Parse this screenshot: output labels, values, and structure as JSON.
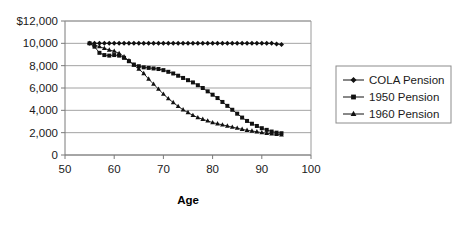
{
  "chart_data": {
    "type": "line",
    "title": "",
    "xlabel": "Age",
    "ylabel": "",
    "xlim": [
      50,
      100
    ],
    "ylim": [
      0,
      12000
    ],
    "grid": true,
    "legend_position": "right",
    "x_ticks": [
      "50",
      "60",
      "70",
      "80",
      "90",
      "100"
    ],
    "x_tick_values": [
      50,
      60,
      70,
      80,
      90,
      100
    ],
    "y_ticks": [
      "0",
      "2,000",
      "4,000",
      "6,000",
      "8,000",
      "10,000",
      "$12,000"
    ],
    "y_tick_values": [
      0,
      2000,
      4000,
      6000,
      8000,
      10000,
      12000
    ],
    "x": [
      55,
      56,
      57,
      58,
      59,
      60,
      61,
      62,
      63,
      64,
      65,
      66,
      67,
      68,
      69,
      70,
      71,
      72,
      73,
      74,
      75,
      76,
      77,
      78,
      79,
      80,
      81,
      82,
      83,
      84,
      85,
      86,
      87,
      88,
      89,
      90,
      91,
      92,
      93,
      94
    ],
    "series": [
      {
        "name": "COLA Pension",
        "marker": "diamond",
        "color": "#111111",
        "values": [
          10000,
          10000,
          10000,
          10000,
          10000,
          10000,
          10000,
          10000,
          10000,
          10000,
          10000,
          10000,
          10000,
          10000,
          10000,
          10000,
          10000,
          10000,
          10000,
          10000,
          10000,
          10000,
          10000,
          10000,
          10000,
          10000,
          10000,
          10000,
          10000,
          10000,
          10000,
          10000,
          10000,
          10000,
          10000,
          10000,
          10000,
          10000,
          9950,
          9900
        ]
      },
      {
        "name": "1950 Pension",
        "marker": "square",
        "color": "#111111",
        "values": [
          10000,
          9700,
          9150,
          8950,
          8900,
          8950,
          8900,
          8700,
          8400,
          8100,
          7950,
          7850,
          7800,
          7750,
          7700,
          7600,
          7450,
          7300,
          7100,
          6900,
          6700,
          6500,
          6250,
          6000,
          5700,
          5400,
          5100,
          4750,
          4400,
          4050,
          3700,
          3350,
          3050,
          2800,
          2600,
          2400,
          2250,
          2100,
          2000,
          1950
        ]
      },
      {
        "name": "1960 Pension",
        "marker": "triangle",
        "color": "#111111",
        "values": [
          10000,
          9850,
          9700,
          9550,
          9400,
          9300,
          9100,
          8800,
          8450,
          8050,
          7700,
          7300,
          6800,
          6350,
          5900,
          5450,
          5050,
          4700,
          4350,
          4050,
          3800,
          3550,
          3350,
          3200,
          3050,
          2900,
          2800,
          2700,
          2600,
          2500,
          2400,
          2300,
          2220,
          2150,
          2080,
          2000,
          1950,
          1900,
          1850,
          1800
        ]
      }
    ]
  },
  "legend": {
    "entries": [
      {
        "label": "COLA Pension",
        "marker": "diamond"
      },
      {
        "label": "1950 Pension",
        "marker": "square"
      },
      {
        "label": "1960 Pension",
        "marker": "triangle"
      }
    ]
  }
}
